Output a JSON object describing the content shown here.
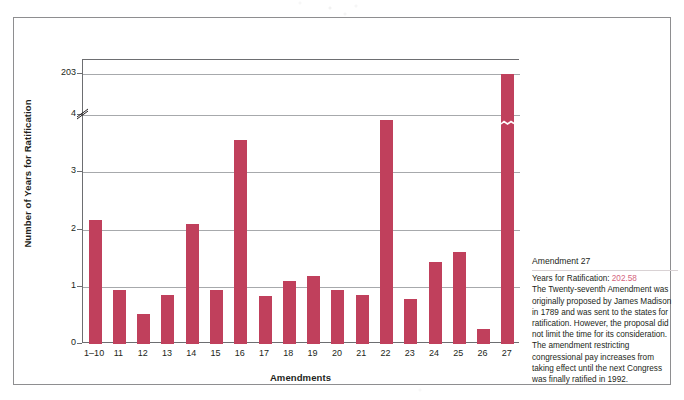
{
  "chart_data": {
    "type": "bar",
    "title": "",
    "xlabel": "Amendments",
    "ylabel": "Number of Years for Ratification",
    "categories": [
      "1–10",
      "11",
      "12",
      "13",
      "14",
      "15",
      "16",
      "17",
      "18",
      "19",
      "20",
      "21",
      "22",
      "23",
      "24",
      "25",
      "26",
      "27"
    ],
    "values": [
      2.17,
      0.95,
      0.52,
      0.86,
      2.09,
      0.95,
      3.56,
      0.83,
      1.1,
      1.18,
      0.95,
      0.85,
      3.92,
      0.78,
      1.43,
      1.6,
      0.27,
      202.58
    ],
    "ytick_labels": [
      "0",
      "1",
      "2",
      "3",
      "4",
      "203"
    ],
    "ytick_values": [
      0,
      1,
      2,
      3,
      4,
      203
    ],
    "ylim": [
      0,
      203
    ],
    "axis_break": {
      "between": [
        4,
        203
      ],
      "present": true
    },
    "grid": true,
    "legend": "none",
    "bar_color": "#c0405c",
    "gridline_color": "#a7a9ac",
    "axis_color": "#6d6e71"
  },
  "info_panel": {
    "title": "Amendment 27",
    "value_label": "Years for Ratification:",
    "value": "202.58",
    "value_color": "#d4637d",
    "body": "The Twenty-seventh Amendment was originally proposed by James Madison in 1789 and was sent to the states for ratification. However, the proposal did not limit the time for its consideration. The amendment restricting congressional pay increases from taking effect until the next Congress was finally ratified in 1992."
  }
}
